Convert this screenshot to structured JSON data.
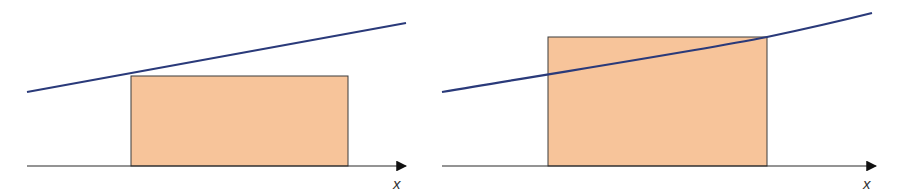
{
  "colors": {
    "rect_fill": "#f7c49a",
    "rect_stroke": "#3a3a3a",
    "curve": "#2a3a7a",
    "axis": "#2b2b2b"
  },
  "panels": [
    {
      "name": "left-endpoint-rectangle",
      "axis_label": "x",
      "axis": {
        "x1": 27,
        "x2": 406,
        "y": 166
      },
      "rect": {
        "x": 131,
        "y": 76,
        "w": 217,
        "h": 90
      },
      "curve": "M27,92 C120,74 250,52 406,23"
    },
    {
      "name": "right-endpoint-rectangle",
      "axis_label": "x",
      "axis": {
        "x1": 442,
        "x2": 876,
        "y": 166
      },
      "rect": {
        "x": 548,
        "y": 37,
        "w": 219,
        "h": 129
      },
      "curve": "M442,92 C560,72 690,52 767,37 C805,29 840,21 872,13"
    }
  ]
}
